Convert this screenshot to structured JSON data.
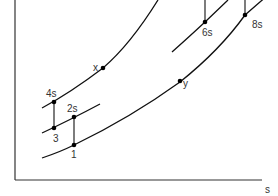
{
  "diagram": {
    "type": "T-s style thermodynamic process diagram",
    "axes": {
      "x_label": "s",
      "y_label": ""
    },
    "points": [
      {
        "id": "1",
        "label": "1"
      },
      {
        "id": "2s",
        "label": "2s"
      },
      {
        "id": "3",
        "label": "3"
      },
      {
        "id": "4s",
        "label": "4s"
      },
      {
        "id": "x",
        "label": "x"
      },
      {
        "id": "y",
        "label": "y"
      },
      {
        "id": "6s",
        "label": "6s"
      },
      {
        "id": "8s",
        "label": "8s"
      }
    ],
    "colors": {
      "line": "#111111",
      "axis": "#333333",
      "background": "#ffffff"
    }
  }
}
